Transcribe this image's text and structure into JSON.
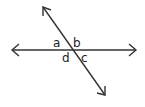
{
  "diagram": {
    "type": "intersecting-lines",
    "line_color": "#333333",
    "horizontal_line": {
      "x1": 12,
      "y1": 50,
      "x2": 136,
      "y2": 50,
      "arrows": "both"
    },
    "transversal_line": {
      "x1": 43,
      "y1": 7,
      "x2": 105,
      "y2": 95,
      "arrows": "both"
    },
    "intersection": {
      "x": 73,
      "y": 50
    },
    "angle_labels": [
      {
        "id": "a",
        "text": "a",
        "x": 53,
        "y": 47
      },
      {
        "id": "b",
        "text": "b",
        "x": 73,
        "y": 47
      },
      {
        "id": "c",
        "text": "c",
        "x": 81,
        "y": 62
      },
      {
        "id": "d",
        "text": "d",
        "x": 62,
        "y": 62
      }
    ]
  }
}
